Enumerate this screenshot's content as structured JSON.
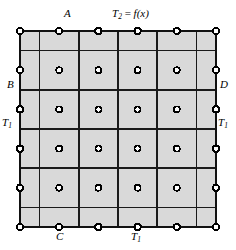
{
  "figure": {
    "type": "mesh-diagram",
    "canvas": {
      "width": 236,
      "height": 250
    },
    "colors": {
      "background": "#ffffff",
      "cell_fill": "#d9d9d9",
      "grid_line": "#1a1a1a",
      "node_stroke": "#000000",
      "node_fill": "#ffffff",
      "label_text": "#000000"
    },
    "mesh": {
      "domain": {
        "x0": 20,
        "y0": 31,
        "x1": 216,
        "y1": 227
      },
      "node_columns_x": [
        20,
        59.2,
        98.4,
        137.6,
        176.8,
        216
      ],
      "node_rows_y": [
        31,
        70.2,
        109.4,
        148.6,
        187.8,
        227
      ],
      "cell_boundaries_x": [
        20,
        39.6,
        78.8,
        118,
        157.2,
        196.4,
        216
      ],
      "cell_boundaries_y": [
        31,
        50.6,
        89.8,
        129,
        168.2,
        207.4,
        227
      ],
      "thin_boundary_x": [
        39.6,
        196.4
      ],
      "thin_boundary_y": [
        50.6,
        207.4
      ],
      "node_count_x": 6,
      "node_count_y": 6,
      "node_radius_interior": 3.0,
      "node_radius_edge": 3.2,
      "line_width_thick": 1.7,
      "line_width_thin": 1.0
    },
    "labels": [
      {
        "id": "label-A",
        "text": "A",
        "sub": "",
        "x": 70,
        "y": 9,
        "align": "center",
        "style": "italic"
      },
      {
        "id": "label-T2",
        "text": "T",
        "sub": "2",
        "suffix": " = ",
        "fn": "f(x)",
        "x": 137,
        "y": 9,
        "align": "center",
        "style": "italic"
      },
      {
        "id": "label-B",
        "text": "B",
        "sub": "",
        "x": 9,
        "y": 84,
        "align": "left",
        "style": "italic"
      },
      {
        "id": "label-D",
        "text": "D",
        "sub": "",
        "x": 220,
        "y": 84,
        "align": "left",
        "style": "italic"
      },
      {
        "id": "label-T1-left",
        "text": "T",
        "sub": "1",
        "x": 3,
        "y": 121,
        "align": "left",
        "style": "italic"
      },
      {
        "id": "label-T1-right",
        "text": "T",
        "sub": "1",
        "x": 218,
        "y": 121,
        "align": "left",
        "style": "italic"
      },
      {
        "id": "label-C",
        "text": "C",
        "sub": "",
        "x": 60,
        "y": 232,
        "align": "center",
        "style": "italic"
      },
      {
        "id": "label-T1-bottom",
        "text": "T",
        "sub": "1",
        "x": 137,
        "y": 232,
        "align": "center",
        "style": "italic"
      }
    ],
    "label_text_plain": {
      "A": "A",
      "B": "B",
      "C": "C",
      "D": "D",
      "T1": "T₁",
      "T2": "T₂ = f(x)"
    },
    "boundary_conditions": {
      "top": "T₂ = f(x)",
      "left": "T₁",
      "right": "T₁",
      "bottom": "T₁"
    },
    "corner_markers": [
      "A",
      "B",
      "C",
      "D"
    ]
  }
}
